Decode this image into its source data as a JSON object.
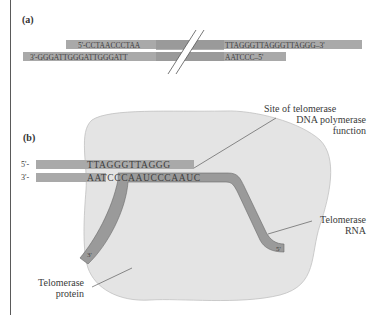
{
  "panel_a": {
    "label": "(a)",
    "top_left_seq": "5'-CCTAACCCTAA",
    "top_right_seq": "TTAGGGTTAGGGTTAGGG–3'",
    "bottom_left_seq": "3'-GGGATTGGGATTGGGATT",
    "bottom_right_seq": "AATCCC–5'"
  },
  "panel_b": {
    "label": "(b)",
    "strand_top_end": "5'-",
    "strand_bottom_end": "3'-",
    "top_seq": "TTAGGGTTAGGG",
    "bottom_seq": "AATCCCAAUCCCAAUC",
    "rna_3_end": "3'",
    "rna_5_end": "5'",
    "labels": {
      "site_line1": "Site of telomerase",
      "site_line2": "DNA polymerase",
      "site_line3": "function",
      "rna_line1": "Telomerase",
      "rna_line2": "RNA",
      "protein_line1": "Telomerase",
      "protein_line2": "protein"
    }
  },
  "colors": {
    "strand": "#a9a9a9",
    "strand_dark": "#8f8f8f",
    "protein": "#e4e4e4",
    "protein_edge": "#bdbdbd",
    "rna": "#9a9a9a",
    "frame": "#5a5a5a"
  }
}
